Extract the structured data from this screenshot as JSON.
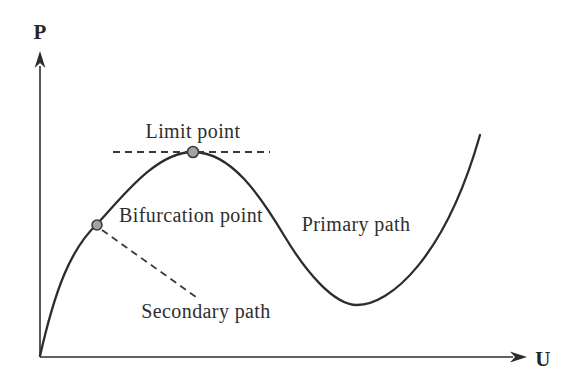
{
  "figure": {
    "type": "equilibrium-path-diagram",
    "axes": {
      "y_label": "P",
      "x_label": "U"
    },
    "annotations": {
      "limit_point": "Limit point",
      "bifurcation_point": "Bifurcation point",
      "primary_path": "Primary path",
      "secondary_path": "Secondary path"
    },
    "colors": {
      "background": "#ffffff",
      "curve": "#2d2d2d",
      "dashed_line": "#3a3a3a",
      "text": "#2e2e2e",
      "marker_fill": "#a3a3a3",
      "marker_stroke": "#3b3b3b"
    },
    "key_points": {
      "origin": {
        "x": 40,
        "y": 356
      },
      "bifurcation_point_marker": {
        "x": 97,
        "y": 225
      },
      "limit_point_marker": {
        "x": 193,
        "y": 152
      },
      "valley_minimum": {
        "x": 357,
        "y": 305
      },
      "curve_end": {
        "x": 480,
        "y": 135
      }
    }
  }
}
